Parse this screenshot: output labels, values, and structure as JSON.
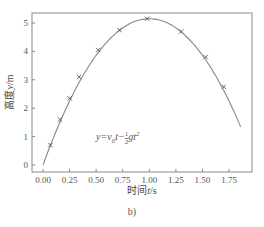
{
  "chart_data": {
    "type": "line",
    "title": "",
    "xlabel": "时间 t/s",
    "ylabel": "高度 y/m",
    "xlim": [
      -0.08,
      1.95
    ],
    "ylim": [
      -0.25,
      5.35
    ],
    "xticks": [
      "0.00",
      "0.25",
      "0.50",
      "0.75",
      "1.00",
      "1.25",
      "1.50",
      "1.75"
    ],
    "yticks": [
      "0",
      "1",
      "2",
      "3",
      "4",
      "5"
    ],
    "grid": false,
    "series": [
      {
        "name": "measured",
        "marker": "x",
        "x": [
          0.07,
          0.16,
          0.25,
          0.34,
          0.52,
          0.72,
          0.98,
          1.3,
          1.53,
          1.7
        ],
        "y": [
          0.7,
          1.6,
          2.35,
          3.1,
          4.05,
          4.75,
          5.15,
          4.7,
          3.8,
          2.75
        ]
      },
      {
        "name": "fit y=v0 t - 1/2 g t^2",
        "marker": "none",
        "v0": 10.3,
        "g": 10.3,
        "x_range": [
          0.0,
          1.86
        ]
      }
    ],
    "annotation": "y=v0t-1/2gt2",
    "caption": "b)"
  },
  "labels": {
    "xlabel_cn": "时间",
    "xlabel_var": "t",
    "xlabel_unit": "/s",
    "ylabel_cn": "高度",
    "ylabel_var": "y",
    "ylabel_unit": "/m",
    "formula_lhs": "y=v",
    "formula_sub": "0",
    "formula_mid": "t−",
    "frac_num": "1",
    "frac_den": "2",
    "formula_rhs": "gt",
    "formula_sup": "2",
    "caption": "b)"
  },
  "colors": {
    "axis": "#777777",
    "curve": "#888888",
    "marker": "#555555"
  }
}
